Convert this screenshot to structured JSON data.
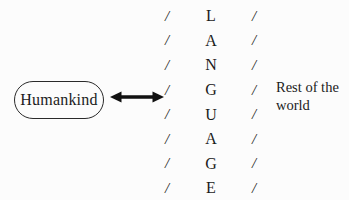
{
  "diagram": {
    "humankind_label": "Humankind",
    "slash": "/",
    "letters": [
      "L",
      "A",
      "N",
      "G",
      "U",
      "A",
      "G",
      "E"
    ],
    "vertical_word": "LANGUAGE",
    "rest_line1": "Rest of the",
    "rest_line2": "world"
  },
  "icons": {
    "double_arrow": "left-right-arrow"
  },
  "colors": {
    "ink": "#1b1b1b",
    "background": "#fcfcfc"
  }
}
